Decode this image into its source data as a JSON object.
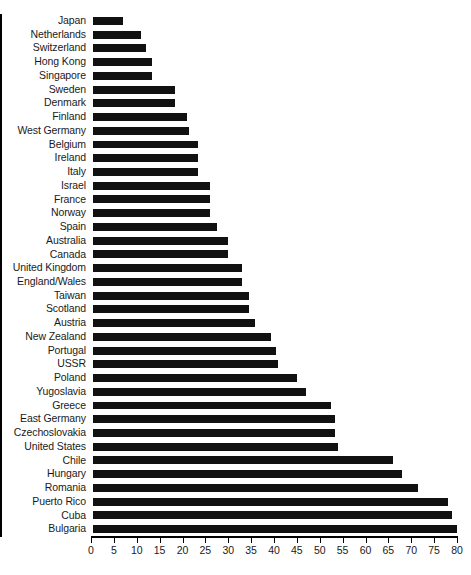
{
  "chart_data": {
    "type": "bar",
    "orientation": "horizontal",
    "title": "",
    "subtitle": "",
    "xlabel": "",
    "ylabel": "",
    "xlim": [
      0,
      80
    ],
    "ylim": null,
    "grid": false,
    "legend": null,
    "legend_position": "none",
    "bar_color": "#111111",
    "axis_color": "#000000",
    "xticks": [
      0,
      5,
      10,
      15,
      20,
      25,
      30,
      35,
      40,
      45,
      50,
      55,
      60,
      65,
      70,
      75,
      80
    ],
    "xtick_labels": [
      "0",
      "5",
      "10",
      "15",
      "20",
      "25",
      "30",
      "35",
      "40",
      "45",
      "50",
      "55",
      "60",
      "65",
      "70",
      "75",
      "80"
    ],
    "categories": [
      "Japan",
      "Netherlands",
      "Switzerland",
      "Hong Kong",
      "Singapore",
      "Sweden",
      "Denmark",
      "Finland",
      "West Germany",
      "Belgium",
      "Ireland",
      "Italy",
      "Israel",
      "France",
      "Norway",
      "Spain",
      "Australia",
      "Canada",
      "United Kingdom",
      "England/Wales",
      "Taiwan",
      "Scotland",
      "Austria",
      "New Zealand",
      "Portugal",
      "USSR",
      "Poland",
      "Yugoslavia",
      "Greece",
      "East Germany",
      "Czechoslovakia",
      "United States",
      "Chile",
      "Hungary",
      "Romania",
      "Puerto Rico",
      "Cuba",
      "Bulgaria"
    ],
    "values": [
      6.5,
      10.5,
      11.5,
      13.0,
      13.0,
      18.0,
      18.0,
      20.5,
      21.0,
      23.0,
      23.0,
      23.0,
      25.5,
      25.5,
      25.5,
      27.0,
      29.5,
      29.5,
      32.5,
      32.5,
      34.0,
      34.0,
      35.5,
      39.0,
      40.0,
      40.5,
      44.5,
      46.5,
      52.0,
      53.0,
      53.0,
      53.5,
      65.5,
      67.5,
      71.0,
      77.5,
      78.5,
      79.5
    ]
  },
  "caption": {
    "fragment": ""
  }
}
